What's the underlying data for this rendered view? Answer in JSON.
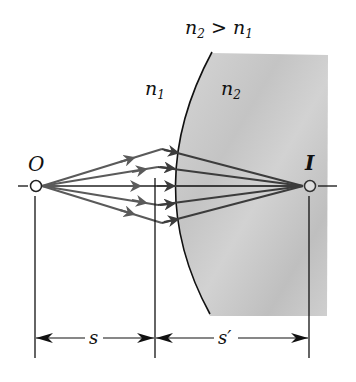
{
  "condition_label": {
    "n2": "n",
    "n2_sub": "2",
    "gt": " > ",
    "n1": "n",
    "n1_sub": "1"
  },
  "medium1_label": {
    "base": "n",
    "sub": "1"
  },
  "medium2_label": {
    "base": "n",
    "sub": "2"
  },
  "object_label": "O",
  "image_label": "I",
  "object_distance_label": "s",
  "image_distance_label": "s′",
  "colors": {
    "ray": "#5a5a5a",
    "ray_refracted": "#3c3c3c",
    "medium2_fill": "#c9c9c9",
    "line": "#111111"
  }
}
